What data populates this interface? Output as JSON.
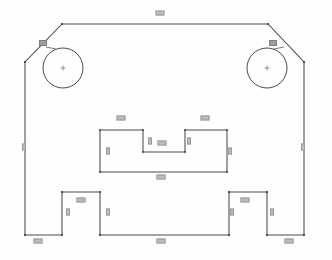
{
  "drawing": {
    "type": "cad-2d-profile-sketch",
    "title": "Symmetric bracket profile with chamfered corners, twin bores, central stepped pocket and two bottom tabs",
    "line_color": "#4a4a4a",
    "background_color": "#fefefe",
    "label_fill_color": "#bdbdbd",
    "label_text_color": "#2e2e2e",
    "units_note": ""
  },
  "outer_profile": {
    "name": "outer-profile",
    "description": "Closed polyline: chamfered top-left and top-right corners, full-height vertical sides, bottom edge interrupted by two raised rectangular tabs",
    "points": [
      {
        "x": 62,
        "y": 24
      },
      {
        "x": 268,
        "y": 24
      },
      {
        "x": 304,
        "y": 62
      },
      {
        "x": 304,
        "y": 235
      },
      {
        "x": 267,
        "y": 235
      },
      {
        "x": 267,
        "y": 192
      },
      {
        "x": 229,
        "y": 192
      },
      {
        "x": 229,
        "y": 235
      },
      {
        "x": 100,
        "y": 235
      },
      {
        "x": 100,
        "y": 192
      },
      {
        "x": 62,
        "y": 192
      },
      {
        "x": 62,
        "y": 235
      },
      {
        "x": 25,
        "y": 235
      },
      {
        "x": 25,
        "y": 62
      }
    ]
  },
  "pocket": {
    "name": "central-stepped-pocket",
    "description": "Rectangular pocket with a rectangular notch cut into its top edge, centered horizontally",
    "points": [
      {
        "x": 100,
        "y": 130
      },
      {
        "x": 143,
        "y": 130
      },
      {
        "x": 143,
        "y": 152
      },
      {
        "x": 185,
        "y": 152
      },
      {
        "x": 185,
        "y": 130
      },
      {
        "x": 227,
        "y": 130
      },
      {
        "x": 227,
        "y": 172
      },
      {
        "x": 100,
        "y": 172
      }
    ]
  },
  "holes": [
    {
      "name": "bore-left",
      "cx": 63,
      "cy": 68,
      "r": 20,
      "center_mark": true
    },
    {
      "name": "bore-right",
      "cx": 267,
      "cy": 68,
      "r": 20,
      "center_mark": true
    }
  ],
  "leaders": [
    {
      "name": "leader-bore-left",
      "label": "",
      "from": {
        "x": 56,
        "y": 49
      },
      "to": {
        "x": 46,
        "y": 47
      },
      "label_x": 43,
      "label_y": 43
    },
    {
      "name": "leader-bore-right",
      "label": "",
      "from": {
        "x": 274,
        "y": 49
      },
      "to": {
        "x": 284,
        "y": 47
      },
      "label_x": 273,
      "label_y": 43
    }
  ],
  "dimensions": [
    {
      "name": "dim-top-width",
      "label": "",
      "orientation": "horizontal",
      "x": 160,
      "y": 13
    },
    {
      "name": "dim-left-height",
      "label": "",
      "orientation": "vertical",
      "x": 24,
      "y": 147
    },
    {
      "name": "dim-right-height",
      "label": "",
      "orientation": "vertical",
      "x": 303,
      "y": 147
    },
    {
      "name": "dim-pocket-top-left",
      "label": "",
      "orientation": "horizontal",
      "x": 121,
      "y": 118
    },
    {
      "name": "dim-pocket-top-right",
      "label": "",
      "orientation": "horizontal",
      "x": 205,
      "y": 118
    },
    {
      "name": "dim-pocket-left",
      "label": "",
      "orientation": "vertical",
      "x": 108,
      "y": 151
    },
    {
      "name": "dim-pocket-right",
      "label": "",
      "orientation": "vertical",
      "x": 230,
      "y": 151
    },
    {
      "name": "dim-notch-left",
      "label": "",
      "orientation": "vertical",
      "x": 150,
      "y": 141
    },
    {
      "name": "dim-notch-right",
      "label": "",
      "orientation": "vertical",
      "x": 189,
      "y": 141
    },
    {
      "name": "dim-notch-floor",
      "label": "",
      "orientation": "horizontal",
      "x": 162,
      "y": 143
    },
    {
      "name": "dim-pocket-bottom",
      "label": "",
      "orientation": "horizontal",
      "x": 161,
      "y": 177
    },
    {
      "name": "dim-tab-left-top",
      "label": "",
      "orientation": "horizontal",
      "x": 81,
      "y": 200
    },
    {
      "name": "dim-tab-left-inner",
      "label": "",
      "orientation": "vertical",
      "x": 68,
      "y": 212
    },
    {
      "name": "dim-tab-left-outer",
      "label": "",
      "orientation": "vertical",
      "x": 108,
      "y": 212
    },
    {
      "name": "dim-tab-right-top",
      "label": "",
      "orientation": "horizontal",
      "x": 245,
      "y": 200
    },
    {
      "name": "dim-tab-right-inner",
      "label": "",
      "orientation": "vertical",
      "x": 232,
      "y": 212
    },
    {
      "name": "dim-tab-right-outer",
      "label": "",
      "orientation": "vertical",
      "x": 272,
      "y": 212
    },
    {
      "name": "dim-bottom-left",
      "label": "",
      "orientation": "horizontal",
      "x": 38,
      "y": 241
    },
    {
      "name": "dim-bottom-center",
      "label": "",
      "orientation": "horizontal",
      "x": 161,
      "y": 241
    },
    {
      "name": "dim-bottom-right",
      "label": "",
      "orientation": "horizontal",
      "x": 289,
      "y": 241
    }
  ]
}
